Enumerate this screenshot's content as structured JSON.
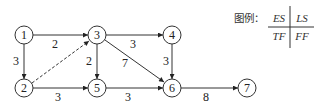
{
  "diagram": {
    "type": "activity-on-arrow network",
    "nodes": [
      {
        "id": "1",
        "label": "1",
        "x": 24,
        "y": 35
      },
      {
        "id": "2",
        "label": "2",
        "x": 24,
        "y": 88
      },
      {
        "id": "3",
        "label": "3",
        "x": 97,
        "y": 35
      },
      {
        "id": "4",
        "label": "4",
        "x": 172,
        "y": 35
      },
      {
        "id": "5",
        "label": "5",
        "x": 97,
        "y": 88
      },
      {
        "id": "6",
        "label": "6",
        "x": 172,
        "y": 88
      },
      {
        "id": "7",
        "label": "7",
        "x": 247,
        "y": 88
      }
    ],
    "edges": [
      {
        "from": "1",
        "to": "3",
        "duration": "2",
        "dashed": false
      },
      {
        "from": "1",
        "to": "2",
        "duration": "3",
        "dashed": false
      },
      {
        "from": "2",
        "to": "3",
        "duration": "",
        "dashed": true
      },
      {
        "from": "2",
        "to": "5",
        "duration": "3",
        "dashed": false
      },
      {
        "from": "3",
        "to": "4",
        "duration": "3",
        "dashed": false
      },
      {
        "from": "3",
        "to": "5",
        "duration": "2",
        "dashed": false
      },
      {
        "from": "3",
        "to": "6",
        "duration": "7",
        "dashed": false
      },
      {
        "from": "4",
        "to": "6",
        "duration": "3",
        "dashed": false
      },
      {
        "from": "5",
        "to": "6",
        "duration": "3",
        "dashed": false
      },
      {
        "from": "6",
        "to": "7",
        "duration": "8",
        "dashed": false
      }
    ]
  },
  "legend": {
    "title": "图例：",
    "top_left": "ES",
    "top_right": "LS",
    "bottom_left": "TF",
    "bottom_right": "FF"
  }
}
